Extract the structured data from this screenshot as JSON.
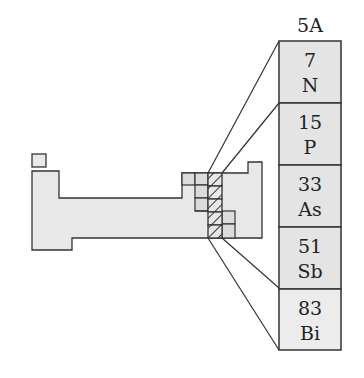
{
  "group": {
    "label": "5A"
  },
  "elements": [
    {
      "atomic_number": "7",
      "symbol": "N"
    },
    {
      "atomic_number": "15",
      "symbol": "P"
    },
    {
      "atomic_number": "33",
      "symbol": "As"
    },
    {
      "atomic_number": "51",
      "symbol": "Sb"
    },
    {
      "atomic_number": "83",
      "symbol": "Bi"
    }
  ],
  "colors": {
    "cell_fill": "#e4e4e4",
    "table_fill": "#e8e8e8",
    "stroke": "#333333",
    "highlight_fill": "#d6d6d6"
  }
}
